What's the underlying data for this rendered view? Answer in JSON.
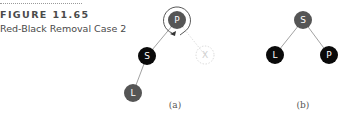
{
  "figure": {
    "label": "FIGURE 11.65",
    "caption": "Red-Black Removal Case 2"
  },
  "colors": {
    "red_node": "#555555",
    "black_node": "#0a0a0a",
    "edge": "#8a8a8a",
    "removed_node_outline": "#c8c8c8",
    "rotation_arrow": "#444444"
  },
  "diagrams": [
    {
      "caption": "(a)",
      "nodes": [
        {
          "id": "P",
          "label": "P",
          "color": "red",
          "note": "rotation around this node"
        },
        {
          "id": "S",
          "label": "S",
          "color": "black"
        },
        {
          "id": "L",
          "label": "L",
          "color": "red"
        },
        {
          "id": "X",
          "label": "X",
          "color": "removed",
          "style": "dashed"
        }
      ],
      "edges": [
        [
          "P",
          "S"
        ],
        [
          "S",
          "L"
        ],
        [
          "P",
          "X"
        ]
      ]
    },
    {
      "caption": "(b)",
      "nodes": [
        {
          "id": "S",
          "label": "S",
          "color": "red"
        },
        {
          "id": "L",
          "label": "L",
          "color": "black"
        },
        {
          "id": "P",
          "label": "P",
          "color": "black"
        }
      ],
      "edges": [
        [
          "S",
          "L"
        ],
        [
          "S",
          "P"
        ]
      ]
    }
  ]
}
